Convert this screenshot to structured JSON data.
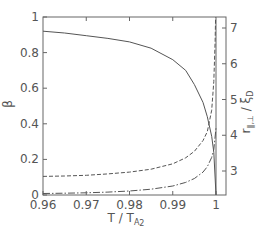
{
  "chart_data": {
    "type": "line",
    "title": "",
    "xlabel": "T / T_A2",
    "ylabel": "β",
    "ylabel_right": "r∥,⊥ / ξD",
    "xlim": [
      0.96,
      1.0025
    ],
    "ylim": [
      0,
      1
    ],
    "ylim_right": [
      2.35,
      7.3
    ],
    "grid": false,
    "x_ticks": [
      0.96,
      0.97,
      0.98,
      0.99,
      1
    ],
    "x_tick_labels": [
      "0.96",
      "0.97",
      "0.98",
      "0.99",
      "1"
    ],
    "y_ticks": [
      0,
      0.2,
      0.4,
      0.6,
      0.8,
      1
    ],
    "y_tick_labels": [
      "0",
      "0.2",
      "0.4",
      "0.6",
      "0.8",
      "1"
    ],
    "y_right_ticks": [
      3,
      4,
      5,
      6,
      7
    ],
    "y_right_tick_labels": [
      "3",
      "4",
      "5",
      "6",
      "7"
    ],
    "series": [
      {
        "name": "β",
        "axis": "left",
        "style": "solid",
        "x": [
          0.96,
          0.965,
          0.97,
          0.975,
          0.98,
          0.985,
          0.99,
          0.993,
          0.995,
          0.997,
          0.998,
          0.999,
          0.9995,
          1.0
        ],
        "y": [
          0.92,
          0.91,
          0.895,
          0.88,
          0.86,
          0.825,
          0.76,
          0.7,
          0.62,
          0.52,
          0.44,
          0.33,
          0.24,
          0.0
        ]
      },
      {
        "name": "r∥ / ξD",
        "axis": "right",
        "style": "dashed",
        "x": [
          0.96,
          0.965,
          0.97,
          0.975,
          0.98,
          0.985,
          0.99,
          0.993,
          0.995,
          0.997,
          0.998,
          0.999,
          0.9995,
          0.9998,
          0.9999
        ],
        "y": [
          2.85,
          2.86,
          2.88,
          2.92,
          2.97,
          3.05,
          3.2,
          3.37,
          3.55,
          3.85,
          4.1,
          4.7,
          5.5,
          6.6,
          7.3
        ]
      },
      {
        "name": "r⊥ / ξD",
        "axis": "right",
        "style": "dash-dot",
        "x": [
          0.96,
          0.965,
          0.97,
          0.975,
          0.98,
          0.985,
          0.99,
          0.993,
          0.995,
          0.997,
          0.998,
          0.999,
          0.9995,
          1.0
        ],
        "y": [
          2.37,
          2.38,
          2.39,
          2.41,
          2.44,
          2.49,
          2.58,
          2.68,
          2.79,
          2.97,
          3.12,
          3.38,
          3.6,
          4.2
        ]
      }
    ],
    "annotations": [
      "vertical line at T/T_A2 = 1"
    ]
  },
  "labels": {
    "top_cropped_text": "Figure caption text (cropped)",
    "x_axis_title_main": "T / T",
    "x_axis_title_sub": "A",
    "x_axis_title_subsub": "2",
    "y_axis_title": "β",
    "y_right_axis_title_main": "r",
    "y_right_axis_title_sub": "∥,⊥",
    "y_right_axis_title_rest": " / ξ",
    "y_right_axis_title_rest_sub": "D"
  }
}
